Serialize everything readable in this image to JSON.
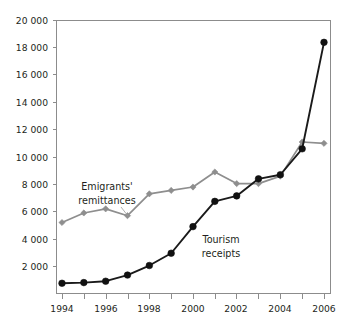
{
  "chart_data": {
    "type": "line",
    "title": "",
    "subtitle": "",
    "xlabel": "",
    "ylabel": "",
    "x": [
      1994,
      1995,
      1996,
      1997,
      1998,
      1999,
      2000,
      2001,
      2002,
      2003,
      2004,
      2005,
      2006
    ],
    "categories": [
      "1994",
      "1995",
      "1996",
      "1997",
      "1998",
      "1999",
      "2000",
      "2001",
      "2002",
      "2003",
      "2004",
      "2005",
      "2006"
    ],
    "xlim": [
      1993.6,
      2006.4
    ],
    "ylim": [
      0,
      20000
    ],
    "xtick_labels": [
      "1994",
      "1996",
      "1998",
      "2000",
      "2002",
      "2004",
      "2006"
    ],
    "xtick_values": [
      1994,
      1996,
      1998,
      2000,
      2002,
      2004,
      2006
    ],
    "xtick_minor_values": [
      1995,
      1997,
      1999,
      2001,
      2003,
      2005
    ],
    "ytick_labels": [
      "2 000",
      "4 000",
      "6 000",
      "8 000",
      "10 000",
      "12 000",
      "14 000",
      "16 000",
      "18 000",
      "20 000"
    ],
    "ytick_values": [
      2000,
      4000,
      6000,
      8000,
      10000,
      12000,
      14000,
      16000,
      18000,
      20000
    ],
    "grid": false,
    "legend_position": "inline-annotation",
    "series": [
      {
        "name": "Emigrants' remittances",
        "color": "#8e8e8e",
        "marker": "diamond",
        "values": [
          5200,
          5900,
          6200,
          5700,
          7300,
          7550,
          7800,
          8900,
          8050,
          8050,
          8600,
          11100,
          11000
        ]
      },
      {
        "name": "Tourism receipts",
        "color": "#111111",
        "marker": "circle",
        "values": [
          750,
          800,
          900,
          1350,
          2050,
          2950,
          4900,
          6750,
          7150,
          8400,
          8700,
          10600,
          18400
        ]
      }
    ],
    "annotations": [
      {
        "id": "emigrants-remittances-label",
        "lines": [
          "Emigrants'",
          "remittances"
        ],
        "line1": "Emigrants'",
        "line2": "remittances",
        "x": 1998.2,
        "y": 12200
      },
      {
        "id": "tourism-receipts-label",
        "lines": [
          "Tourism",
          "receipts"
        ],
        "line1": "Tourism",
        "line2": "receipts",
        "x": 2002.0,
        "y": 4200
      }
    ]
  },
  "axis": {
    "y_labels": {
      "t20000": "20 000",
      "t18000": "18 000",
      "t16000": "16 000",
      "t14000": "14 000",
      "t12000": "12 000",
      "t10000": "10 000",
      "t8000": "8 000",
      "t6000": "6 000",
      "t4000": "4 000",
      "t2000": "2 000"
    },
    "x_labels": {
      "y1994": "1994",
      "y1996": "1996",
      "y1998": "1998",
      "y2000": "2000",
      "y2002": "2002",
      "y2004": "2004",
      "y2006": "2006"
    }
  },
  "labels": {
    "emigrants_line1": "Emigrants'",
    "emigrants_line2": "remittances",
    "tourism_line1": "Tourism",
    "tourism_line2": "receipts"
  },
  "colors": {
    "series_gray": "#8e8e8e",
    "series_black": "#111111",
    "axis": "#8c8c8c",
    "text": "#231f20",
    "background": "#ffffff"
  }
}
